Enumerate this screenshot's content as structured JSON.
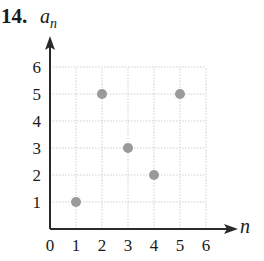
{
  "problem": {
    "number_label": "14.",
    "y_axis_var": "a",
    "y_axis_sub": "n",
    "x_axis_var": "n"
  },
  "colors": {
    "axis": "#2a2a2a",
    "grid": "#cfcfcf",
    "point": "#9a9a9a",
    "text": "#1a1a1a"
  },
  "chart_data": {
    "type": "scatter",
    "title": "14.",
    "xlabel": "n",
    "ylabel": "a_n",
    "x": [
      1,
      2,
      3,
      4,
      5
    ],
    "y": [
      1,
      5,
      3,
      2,
      5
    ],
    "series": [
      {
        "name": "a_n",
        "points": [
          [
            1,
            1
          ],
          [
            2,
            5
          ],
          [
            3,
            3
          ],
          [
            4,
            2
          ],
          [
            5,
            5
          ]
        ]
      }
    ],
    "xlim": [
      0,
      6
    ],
    "ylim": [
      0,
      6
    ],
    "x_ticks": [
      "0",
      "1",
      "2",
      "3",
      "4",
      "5",
      "6"
    ],
    "y_ticks": [
      "1",
      "2",
      "3",
      "4",
      "5",
      "6"
    ],
    "grid": true,
    "legend": "none"
  }
}
